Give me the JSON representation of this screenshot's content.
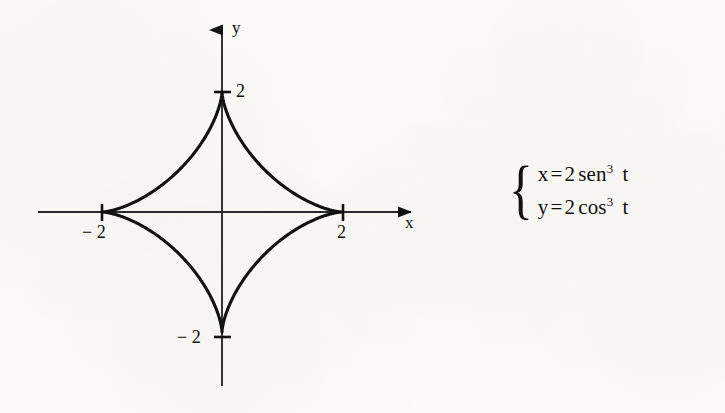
{
  "figure": {
    "background_color": "#fbfaf7",
    "ink_color": "#111111",
    "axes": {
      "x_axis_label": "x",
      "y_axis_label": "y",
      "origin_px": [
        222,
        212
      ],
      "unit_px": 60
    },
    "tick_labels": {
      "x_positive": "2",
      "x_negative": "− 2",
      "y_positive": "2",
      "y_negative": "− 2"
    }
  },
  "equations": {
    "brace": "{",
    "line1": {
      "lhs": "x",
      "equals": "=",
      "coefficient": "2",
      "function": "sen",
      "exponent": "3",
      "variable": "t"
    },
    "line2": {
      "lhs": "y",
      "equals": "=",
      "coefficient": "2",
      "function": "cos",
      "exponent": "3",
      "variable": "t"
    }
  },
  "chart_data": {
    "type": "line",
    "title": "",
    "xlabel": "x",
    "ylabel": "y",
    "curve_name": "astroid",
    "parametric": {
      "x": "2*sen(t)^3",
      "y": "2*cos(t)^3",
      "t_range": [
        0,
        6.2832
      ]
    },
    "xlim": [
      -3.1,
      3.4
    ],
    "ylim": [
      -2.9,
      3.25
    ],
    "xticks": [
      -2,
      2
    ],
    "xtick_labels": [
      "− 2",
      "2"
    ],
    "yticks": [
      -2,
      2
    ],
    "ytick_labels": [
      "− 2",
      "2"
    ],
    "grid": false,
    "legend": "none",
    "cusps": [
      {
        "x": 0,
        "y": 2
      },
      {
        "x": 2,
        "y": 0
      },
      {
        "x": 0,
        "y": -2
      },
      {
        "x": -2,
        "y": 0
      }
    ],
    "points": [
      {
        "x": 0.0,
        "y": 2.0
      },
      {
        "x": 0.0214,
        "y": 1.8088
      },
      {
        "x": 0.0834,
        "y": 1.6246
      },
      {
        "x": 0.1817,
        "y": 1.4494
      },
      {
        "x": 0.3119,
        "y": 1.2855
      },
      {
        "x": 0.4689,
        "y": 1.134
      },
      {
        "x": 0.6475,
        "y": 0.9956
      },
      {
        "x": 0.8418,
        "y": 0.8707
      },
      {
        "x": 1.0457,
        "y": 0.7589
      },
      {
        "x": 1.2531,
        "y": 0.6597
      },
      {
        "x": 1.4577,
        "y": 0.5721
      },
      {
        "x": 1.6531,
        "y": 0.4951
      },
      {
        "x": 1.8333,
        "y": 0.4277
      },
      {
        "x": 1.9923,
        "y": 0.3688
      },
      {
        "x": 2.0,
        "y": 0.0
      },
      {
        "x": 1.9923,
        "y": -0.3688
      },
      {
        "x": 1.8333,
        "y": -0.4277
      },
      {
        "x": 1.4577,
        "y": -0.5721
      },
      {
        "x": 1.0457,
        "y": -0.7589
      },
      {
        "x": 0.6475,
        "y": -0.9956
      },
      {
        "x": 0.3119,
        "y": -1.2855
      },
      {
        "x": 0.0834,
        "y": -1.6246
      },
      {
        "x": 0.0,
        "y": -2.0
      },
      {
        "x": -0.0834,
        "y": -1.6246
      },
      {
        "x": -0.3119,
        "y": -1.2855
      },
      {
        "x": -0.6475,
        "y": -0.9956
      },
      {
        "x": -1.0457,
        "y": -0.7589
      },
      {
        "x": -1.4577,
        "y": -0.5721
      },
      {
        "x": -1.8333,
        "y": -0.4277
      },
      {
        "x": -2.0,
        "y": 0.0
      },
      {
        "x": -1.8333,
        "y": 0.4277
      },
      {
        "x": -1.4577,
        "y": 0.5721
      },
      {
        "x": -1.0457,
        "y": 0.7589
      },
      {
        "x": -0.6475,
        "y": 0.9956
      },
      {
        "x": -0.3119,
        "y": 1.2855
      },
      {
        "x": -0.0834,
        "y": 1.6246
      },
      {
        "x": 0.0,
        "y": 2.0
      }
    ]
  }
}
